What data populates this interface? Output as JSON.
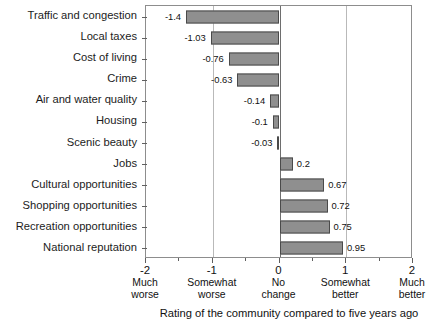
{
  "chart_data": {
    "type": "bar",
    "orientation": "horizontal",
    "title": "",
    "subtitle": "",
    "xlabel": "Rating of the community compared to five years ago",
    "ylabel": "",
    "xlim": [
      -2,
      2
    ],
    "grid": true,
    "gridlines_at": [
      -1,
      1
    ],
    "zero_line": 0,
    "legend": null,
    "major_ticks": [
      -2,
      -1,
      0,
      1,
      2
    ],
    "minor_ticks": [
      -1.5,
      -0.5,
      0.5,
      1.5
    ],
    "categories": [
      "Traffic and congestion",
      "Local taxes",
      "Cost of living",
      "Crime",
      "Air and water quality",
      "Housing",
      "Scenic beauty",
      "Jobs",
      "Cultural opportunities",
      "Shopping opportunities",
      "Recreation opportunities",
      "National reputation"
    ],
    "values": [
      -1.4,
      -1.03,
      -0.76,
      -0.63,
      -0.14,
      -0.1,
      -0.03,
      0.2,
      0.67,
      0.72,
      0.75,
      0.95
    ],
    "value_labels": [
      "-1.4",
      "-1.03",
      "-0.76",
      "-0.63",
      "-0.14",
      "-0.1",
      "-0.03",
      "0.2",
      "0.67",
      "0.72",
      "0.75",
      "0.95"
    ],
    "tick_labels": [
      {
        "value": "-2",
        "descriptor_line1": "Much",
        "descriptor_line2": "worse"
      },
      {
        "value": "-1",
        "descriptor_line1": "Somewhat",
        "descriptor_line2": "worse"
      },
      {
        "value": "0",
        "descriptor_line1": "No",
        "descriptor_line2": "change"
      },
      {
        "value": "1",
        "descriptor_line1": "Somewhat",
        "descriptor_line2": "better"
      },
      {
        "value": "2",
        "descriptor_line1": "Much",
        "descriptor_line2": "better"
      }
    ],
    "colors": {
      "bar_fill": "#8f8f8f",
      "bar_border": "#4a4a4a",
      "gridline": "#b9b9b9",
      "axis": "#8d8d8d",
      "text": "#111111",
      "background": "#ffffff"
    }
  }
}
